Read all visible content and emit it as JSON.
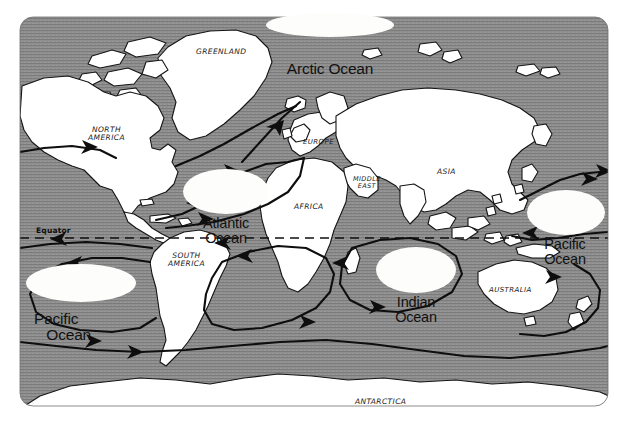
{
  "figure": {
    "kind": "world-map",
    "page_background": "#ffffff",
    "map_frame": {
      "ocean_fill": "#8f8f8f",
      "ocean_texture": "#7a7a7a",
      "land_fill": "#ffffff",
      "outline_color": "#111111",
      "current_color": "#111111",
      "corner_radius": 14
    }
  },
  "ocean_labels": [
    {
      "id": "arctic-ocean",
      "name": "Arctic Ocean",
      "lines": "Arctic Ocean",
      "x": 274,
      "y": 14,
      "w": 112,
      "h": 24,
      "font_size": 15.5,
      "blob": {
        "x": -8,
        "y": -1,
        "w": 128,
        "h": 24
      }
    },
    {
      "id": "atlantic-ocean",
      "name": "Atlantic Ocean",
      "lines": "Atlantic\nOcean",
      "x": 190,
      "y": 172,
      "w": 72,
      "h": 40,
      "font_size": 14.5,
      "blob": {
        "x": -7,
        "y": -3,
        "w": 86,
        "h": 45
      }
    },
    {
      "id": "indian-ocean",
      "name": "Indian Ocean",
      "lines": "Indian\nOcean",
      "x": 384,
      "y": 251,
      "w": 64,
      "h": 40,
      "font_size": 14.5,
      "blob": {
        "x": -8,
        "y": -4,
        "w": 80,
        "h": 46
      }
    },
    {
      "id": "pacific-ocean-east",
      "name": "Pacific Ocean",
      "lines": "Pacific\nOcean",
      "x": 535,
      "y": 193,
      "w": 60,
      "h": 40,
      "font_size": 14.5,
      "blob": {
        "x": -8,
        "y": -3,
        "w": 78,
        "h": 45
      }
    },
    {
      "id": "pacific-ocean-west",
      "name": "Pacific Ocean",
      "lines": "Pacific\n   Ocean",
      "x": 34,
      "y": 264,
      "w": 92,
      "h": 40,
      "font_size": 15.5,
      "blob": {
        "x": -8,
        "y": 0,
        "w": 110,
        "h": 38
      }
    }
  ],
  "continent_labels": [
    {
      "id": "greenland",
      "name": "GREENLAND",
      "lines": "GREENLAND",
      "x": 196,
      "y": 48,
      "font_size": 7.5
    },
    {
      "id": "north-america",
      "name": "NORTH AMERICA",
      "lines": "NORTH\nAMERICA",
      "x": 88,
      "y": 126,
      "font_size": 7.5
    },
    {
      "id": "europe",
      "name": "EUROPE",
      "lines": "EUROPE",
      "x": 303,
      "y": 139,
      "font_size": 7.0
    },
    {
      "id": "asia",
      "name": "ASIA",
      "lines": "ASIA",
      "x": 437,
      "y": 168,
      "font_size": 7.5
    },
    {
      "id": "middle-east",
      "name": "MIDDLE EAST",
      "lines": "MIDDLE\nEAST",
      "x": 353,
      "y": 176,
      "font_size": 6.5
    },
    {
      "id": "africa",
      "name": "AFRICA",
      "lines": "AFRICA",
      "x": 294,
      "y": 203,
      "font_size": 7.5
    },
    {
      "id": "south-america",
      "name": "SOUTH AMERICA",
      "lines": "SOUTH\nAMERICA",
      "x": 168,
      "y": 252,
      "font_size": 7.5
    },
    {
      "id": "australia",
      "name": "AUSTRALIA",
      "lines": "AUSTRALIA",
      "x": 489,
      "y": 287,
      "font_size": 7.0
    },
    {
      "id": "antarctica",
      "name": "ANTARCTICA",
      "lines": "ANTARCTICA",
      "x": 355,
      "y": 398,
      "font_size": 7.5
    }
  ],
  "equator": {
    "label": "Equator",
    "label_x": 36,
    "label_y": 228,
    "line_y": 238,
    "line_x1": 20,
    "line_x2": 608,
    "style": "dashed"
  }
}
